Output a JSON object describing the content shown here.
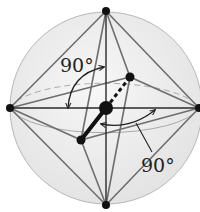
{
  "diagram": {
    "labels": {
      "angle_upper": "90°",
      "angle_lower": "90°"
    },
    "colors": {
      "sphere_fill": "#ececec",
      "sphere_stroke": "#b8b8b8",
      "edge": "#6e6e6e",
      "axis": "#2a2a2a",
      "atom": "#111111"
    },
    "atoms": {
      "center": [
        106,
        108
      ],
      "top": [
        106,
        11
      ],
      "bottom": [
        106,
        205
      ],
      "left": [
        10,
        108
      ],
      "right": [
        199,
        108
      ],
      "back": [
        130,
        77
      ],
      "front": [
        81,
        140
      ]
    }
  }
}
